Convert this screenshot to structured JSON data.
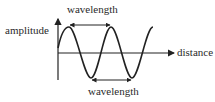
{
  "diagram": {
    "labels": {
      "wavelength_top": "wavelength",
      "wavelength_bottom": "wavelength",
      "y_axis": "amplitude",
      "x_axis": "distance"
    },
    "colors": {
      "stroke": "#222222",
      "text": "#2a2a2a",
      "background": "#ffffff"
    },
    "wave": {
      "type": "sine",
      "period_px": 42,
      "amplitude_px": 25
    }
  }
}
